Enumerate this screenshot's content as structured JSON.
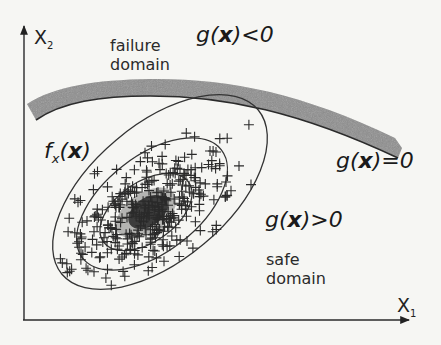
{
  "figure": {
    "axes": {
      "x_label": "X",
      "x_subscript": "1",
      "y_label": "X",
      "y_subscript": "2"
    },
    "labels": {
      "failure_domain_line1": "failure",
      "failure_domain_line2": "domain",
      "safe_domain_line1": "safe",
      "safe_domain_line2": "domain",
      "g_negative_prefix": "g(",
      "g_negative_var": "x",
      "g_negative_suffix": ")<0",
      "g_zero_prefix": "g(",
      "g_zero_var": "x",
      "g_zero_suffix": ")=0",
      "g_positive_prefix": "g(",
      "g_positive_var": "x",
      "g_positive_suffix": ")>0",
      "density_f": "f",
      "density_sub": "x",
      "density_open": "(",
      "density_var": "x",
      "density_close": ")"
    },
    "elements": {
      "limit_state_band": "gray curved band representing g(x)=0",
      "density_contours": 3,
      "sample_marker": "+"
    },
    "colors": {
      "background": "#f6f6f3",
      "ink": "#222222",
      "band": "#8a8a8a",
      "band_edge": "#2b2b2b"
    }
  }
}
